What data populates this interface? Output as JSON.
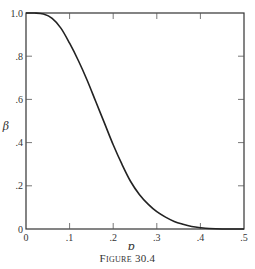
{
  "chart_data": {
    "type": "line",
    "title": "",
    "caption": "Figure 30.4",
    "xlabel": "p",
    "ylabel": "β",
    "xlim": [
      0,
      0.5
    ],
    "ylim": [
      0,
      1.0
    ],
    "grid": false,
    "legend": null,
    "x_ticks": [
      0,
      0.1,
      0.2,
      0.3,
      0.4,
      0.5
    ],
    "x_tick_labels": [
      "0",
      ".1",
      ".2",
      ".3",
      ".4",
      ".5"
    ],
    "y_ticks": [
      0,
      0.2,
      0.4,
      0.6,
      0.8,
      1.0
    ],
    "y_tick_labels": [
      "0",
      ".2",
      ".4",
      ".6",
      ".8",
      "1.0"
    ],
    "series": [
      {
        "name": "β(p)",
        "x": [
          0.0,
          0.02,
          0.04,
          0.06,
          0.08,
          0.1,
          0.12,
          0.14,
          0.16,
          0.18,
          0.2,
          0.22,
          0.24,
          0.26,
          0.28,
          0.3,
          0.32,
          0.34,
          0.36,
          0.38,
          0.4,
          0.42,
          0.45,
          0.5
        ],
        "values": [
          1.0,
          1.0,
          0.995,
          0.975,
          0.93,
          0.86,
          0.78,
          0.69,
          0.59,
          0.49,
          0.39,
          0.3,
          0.22,
          0.16,
          0.115,
          0.08,
          0.055,
          0.035,
          0.022,
          0.012,
          0.006,
          0.002,
          0.0,
          0.0
        ]
      }
    ]
  }
}
